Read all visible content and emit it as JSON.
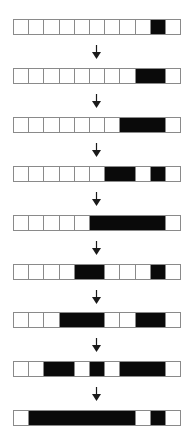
{
  "diagram": {
    "title": "",
    "cell_count": 11,
    "colors": {
      "filled": "#0a0a0a",
      "empty": "#ffffff",
      "border": "#8a8a8a",
      "arrow": "#1a1a1a"
    },
    "rows": [
      {
        "state": [
          0,
          0,
          0,
          0,
          0,
          0,
          0,
          0,
          0,
          1,
          0
        ]
      },
      {
        "state": [
          0,
          0,
          0,
          0,
          0,
          0,
          0,
          0,
          1,
          1,
          0
        ]
      },
      {
        "state": [
          0,
          0,
          0,
          0,
          0,
          0,
          0,
          1,
          1,
          1,
          0
        ]
      },
      {
        "state": [
          0,
          0,
          0,
          0,
          0,
          0,
          1,
          1,
          0,
          1,
          0
        ]
      },
      {
        "state": [
          0,
          0,
          0,
          0,
          0,
          1,
          1,
          1,
          1,
          1,
          0
        ]
      },
      {
        "state": [
          0,
          0,
          0,
          0,
          1,
          1,
          0,
          0,
          0,
          1,
          0
        ]
      },
      {
        "state": [
          0,
          0,
          0,
          1,
          1,
          1,
          0,
          0,
          1,
          1,
          0
        ]
      },
      {
        "state": [
          0,
          0,
          1,
          1,
          0,
          1,
          0,
          1,
          1,
          1,
          0
        ]
      },
      {
        "state": [
          0,
          1,
          1,
          1,
          1,
          1,
          1,
          1,
          0,
          1,
          0
        ]
      }
    ],
    "arrows": [
      {
        "from": 0,
        "to": 1,
        "icon": "down-arrow-icon"
      },
      {
        "from": 1,
        "to": 2,
        "icon": "down-arrow-icon"
      },
      {
        "from": 2,
        "to": 3,
        "icon": "down-arrow-icon"
      },
      {
        "from": 3,
        "to": 4,
        "icon": "down-arrow-icon"
      },
      {
        "from": 4,
        "to": 5,
        "icon": "down-arrow-icon"
      },
      {
        "from": 5,
        "to": 6,
        "icon": "down-arrow-icon"
      },
      {
        "from": 6,
        "to": 7,
        "icon": "down-arrow-icon"
      },
      {
        "from": 7,
        "to": 8,
        "icon": "down-arrow-icon"
      }
    ]
  }
}
